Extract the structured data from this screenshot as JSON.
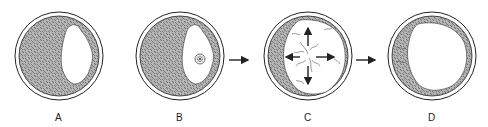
{
  "diagram": {
    "type": "stage-sequence",
    "panels": [
      {
        "id": "A",
        "label": "A",
        "description": "Circle with stippled fill and an irregular clear area on the right side"
      },
      {
        "id": "B",
        "label": "B",
        "description": "Same as A with a small rosette/target inside the clear area"
      },
      {
        "id": "C",
        "label": "C",
        "description": "Large clear area with radiating fibrils and four outward arrows; stippled crescent on left"
      },
      {
        "id": "D",
        "label": "D",
        "description": "Enlarged clear area; thin stippled rim remains around edge"
      }
    ],
    "arrows": [
      {
        "from": "B",
        "to": "C"
      },
      {
        "from": "C",
        "to": "D"
      }
    ],
    "colors": {
      "stroke": "#222222",
      "stipple": "#8a8a8a",
      "background": "#ffffff"
    }
  }
}
